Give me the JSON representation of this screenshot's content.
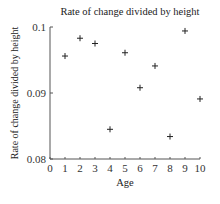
{
  "chart_data": {
    "type": "scatter",
    "title": "Rate of change divided by height",
    "xlabel": "Age",
    "ylabel": "Rate of change divided by height",
    "xlim": [
      0,
      10
    ],
    "ylim": [
      0.08,
      0.1
    ],
    "x_ticks": [
      "0",
      "1",
      "2",
      "3",
      "4",
      "5",
      "6",
      "7",
      "8",
      "9",
      "10"
    ],
    "y_ticks": [
      "0.08",
      "0.09",
      "0.1"
    ],
    "grid": false,
    "marker": "+",
    "marker_color": "#222222",
    "series": [
      {
        "name": "Rate of change divided by height",
        "x": [
          1,
          2,
          3,
          4,
          5,
          6,
          7,
          8,
          9,
          10
        ],
        "y": [
          0.0956,
          0.0983,
          0.0975,
          0.0845,
          0.0961,
          0.0908,
          0.0941,
          0.0834,
          0.0994,
          0.0891
        ]
      }
    ]
  }
}
